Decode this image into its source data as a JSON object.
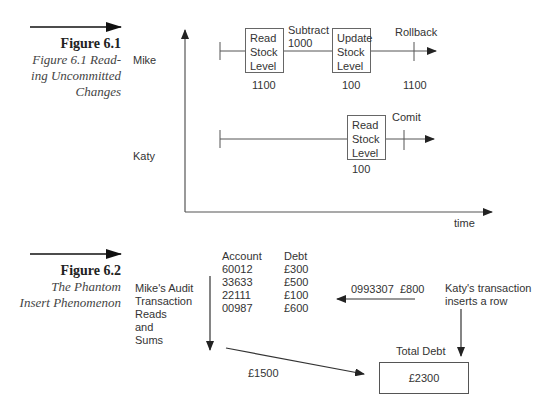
{
  "figure1": {
    "number": "Figure 6.1",
    "caption_lines": [
      "Figure 6.1 Read-",
      "ing Uncommitted",
      "Changes"
    ],
    "axis_label": "time",
    "mike": {
      "label": "Mike",
      "box1": [
        "Read",
        "Stock",
        "Level"
      ],
      "box1_value": "1100",
      "subtract_label": [
        "Subtract",
        "1000"
      ],
      "box2": [
        "Update",
        "Stock",
        "Level"
      ],
      "box2_value": "100",
      "rollback_label": "Rollback",
      "rollback_value": "1100"
    },
    "katy": {
      "label": "Katy",
      "box": [
        "Read",
        "Stock",
        "Level"
      ],
      "box_value": "100",
      "commit_label": "Comit"
    }
  },
  "figure2": {
    "number": "Figure 6.2",
    "caption_lines": [
      "The Phantom",
      "Insert Phenomenon"
    ],
    "mike_label": [
      "Mike's Audit",
      "Transaction",
      "Reads",
      "and",
      "Sums"
    ],
    "table": {
      "headers": [
        "Account",
        "Debt"
      ],
      "rows": [
        [
          "60012",
          "£300"
        ],
        [
          "33633",
          "£500"
        ],
        [
          "22111",
          "£100"
        ],
        [
          "00987",
          "£600"
        ]
      ]
    },
    "inserted_row": "0993307  £800",
    "katy_label": [
      "Katy's transaction",
      "inserts a row"
    ],
    "sum_value": "£1500",
    "total_label": "Total Debt",
    "total_value": "£2300"
  }
}
